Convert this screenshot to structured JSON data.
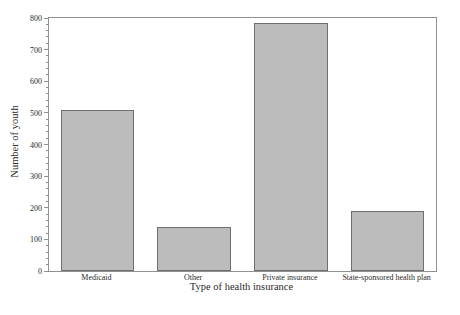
{
  "figure": {
    "background": "#ffffff"
  },
  "chart_data": {
    "type": "bar",
    "title": "",
    "xlabel": "Type of health insurance",
    "ylabel": "Number of youth",
    "categories": [
      "Medicaid",
      "Other",
      "Private insurance",
      "State-sponsored health plan"
    ],
    "values": [
      510,
      140,
      785,
      190
    ],
    "ylim": [
      0,
      800
    ],
    "y_major_tick_step": 100,
    "y_minor_tick_step": 20,
    "y_tick_labels": [
      "0",
      "100",
      "200",
      "300",
      "400",
      "500",
      "600",
      "700",
      "800"
    ],
    "grid": "off",
    "legend": "none",
    "colors": {
      "bar_fill": "#bcbcbc",
      "bar_border": "#6f6f6f",
      "axis": "#919191",
      "text": "#2a2a2a"
    }
  }
}
